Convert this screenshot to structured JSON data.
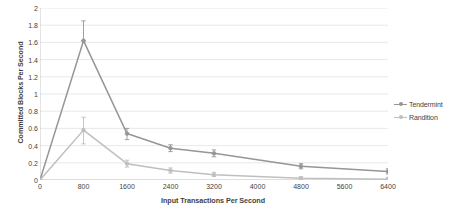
{
  "chart_data": {
    "type": "line",
    "title": "",
    "xlabel": "Input Transactions Per Second",
    "ylabel": "Committed Blocks Per Second",
    "xlim": [
      0,
      6400
    ],
    "ylim": [
      0,
      2
    ],
    "grid": true,
    "legend_position": "right",
    "x_ticks": [
      0,
      800,
      1600,
      2400,
      3200,
      4000,
      4800,
      5600,
      6400
    ],
    "x_tick_labels": [
      "0",
      "800",
      "1600",
      "2400",
      "3200",
      "4000",
      "4800",
      "5600",
      "6400"
    ],
    "y_ticks": [
      0,
      0.2,
      0.4,
      0.6,
      0.8,
      1,
      1.2,
      1.4,
      1.6,
      1.8,
      2
    ],
    "y_tick_labels": [
      "0",
      "0.2",
      "0.4",
      "0.6",
      "0.8",
      "1",
      "1.2",
      "1.4",
      "1.6",
      "1.8",
      "2"
    ],
    "series": [
      {
        "name": "Tendermint",
        "color": "#969696",
        "x": [
          0,
          800,
          1600,
          2400,
          3200,
          4800,
          6400
        ],
        "values": [
          0.0,
          1.62,
          0.54,
          0.37,
          0.31,
          0.16,
          0.1
        ],
        "error_low": [
          0.0,
          1.62,
          0.47,
          0.33,
          0.27,
          0.13,
          0.07
        ],
        "error_high": [
          0.0,
          1.85,
          0.6,
          0.41,
          0.35,
          0.19,
          0.13
        ]
      },
      {
        "name": "Randition",
        "color": "#bfbfbf",
        "x": [
          0,
          800,
          1600,
          2400,
          3200,
          4800,
          6400
        ],
        "values": [
          0.0,
          0.58,
          0.19,
          0.11,
          0.06,
          0.02,
          0.01
        ],
        "error_low": [
          0.0,
          0.42,
          0.15,
          0.08,
          0.04,
          0.01,
          0.0
        ],
        "error_high": [
          0.0,
          0.73,
          0.23,
          0.14,
          0.09,
          0.04,
          0.03
        ]
      }
    ]
  },
  "legend": {
    "items": [
      {
        "label": "Tendermint"
      },
      {
        "label": "Randition"
      }
    ]
  }
}
